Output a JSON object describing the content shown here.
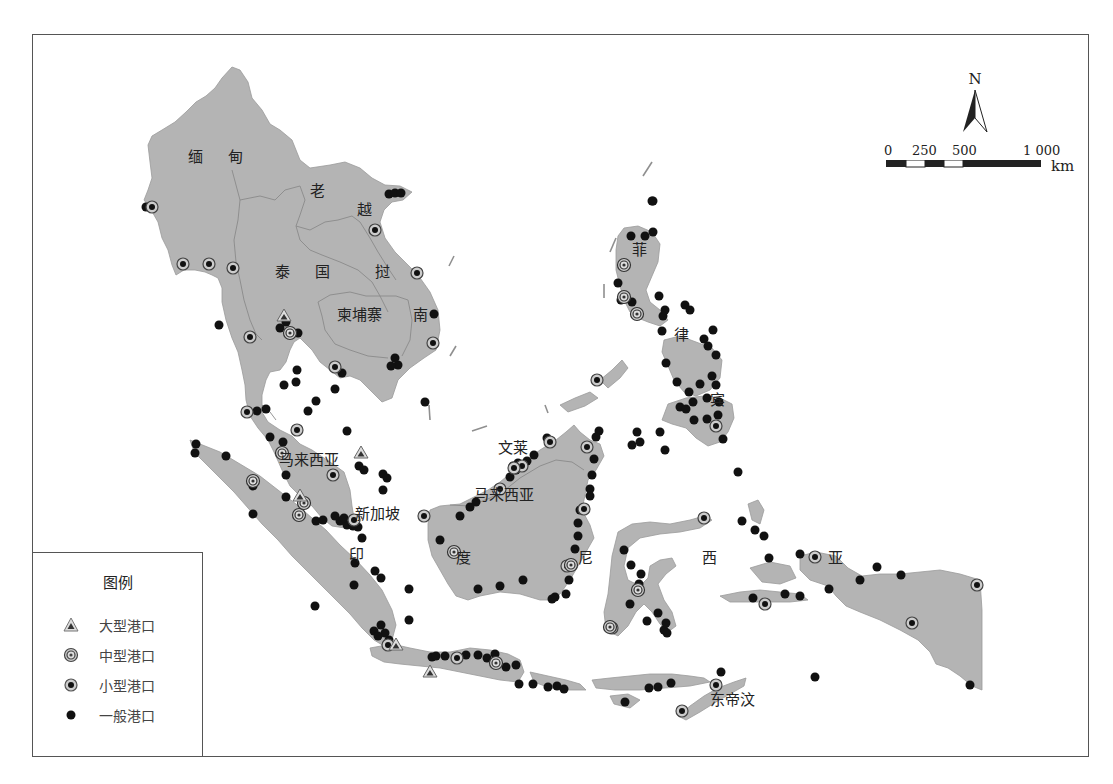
{
  "map": {
    "country_labels": [
      {
        "id": "myanmar",
        "text": "缅 甸",
        "x": 188,
        "y": 155
      },
      {
        "id": "laos",
        "text": "老",
        "x": 310,
        "y": 189
      },
      {
        "id": "vietnam-1",
        "text": "越",
        "x": 357,
        "y": 208
      },
      {
        "id": "thailand",
        "text": "泰 国",
        "x": 275,
        "y": 270
      },
      {
        "id": "vietnam-2",
        "text": "挝",
        "x": 375,
        "y": 270
      },
      {
        "id": "cambodia",
        "text": "柬埔寨",
        "x": 337,
        "y": 313
      },
      {
        "id": "vietnam-3",
        "text": "南",
        "x": 413,
        "y": 313
      },
      {
        "id": "philippines-1",
        "text": "菲",
        "x": 632,
        "y": 248
      },
      {
        "id": "philippines-2",
        "text": "律",
        "x": 674,
        "y": 333
      },
      {
        "id": "philippines-3",
        "text": "宾",
        "x": 710,
        "y": 398
      },
      {
        "id": "malaysia-west",
        "text": "马来西亚",
        "x": 279,
        "y": 458
      },
      {
        "id": "brunei",
        "text": "文莱",
        "x": 498,
        "y": 446
      },
      {
        "id": "malaysia-east",
        "text": "马来西亚",
        "x": 474,
        "y": 493
      },
      {
        "id": "singapore",
        "text": "新加坡",
        "x": 355,
        "y": 512
      },
      {
        "id": "indonesia-1",
        "text": "印",
        "x": 349,
        "y": 553
      },
      {
        "id": "indonesia-2",
        "text": "度",
        "x": 456,
        "y": 556
      },
      {
        "id": "indonesia-3",
        "text": "尼",
        "x": 578,
        "y": 556
      },
      {
        "id": "indonesia-4",
        "text": "西",
        "x": 702,
        "y": 556
      },
      {
        "id": "indonesia-5",
        "text": "亚",
        "x": 828,
        "y": 556
      },
      {
        "id": "east-timor",
        "text": "东帝汶",
        "x": 710,
        "y": 698
      }
    ],
    "compass": {
      "label": "N"
    },
    "scale_bar": {
      "ticks": [
        {
          "label": "0",
          "x": 4
        },
        {
          "label": "250",
          "x": 32
        },
        {
          "label": "500",
          "x": 72
        },
        {
          "label": "1 000",
          "x": 143
        }
      ],
      "unit": "km"
    }
  },
  "legend": {
    "title": "图例",
    "items": [
      {
        "symbol": "triangle",
        "label": "大型港口"
      },
      {
        "symbol": "double-ring",
        "label": "中型港口"
      },
      {
        "symbol": "ring-dot",
        "label": "小型港口"
      },
      {
        "symbol": "dot",
        "label": "一般港口"
      }
    ]
  },
  "ports": {
    "large": [
      [
        284,
        316
      ],
      [
        361,
        453
      ],
      [
        396,
        645
      ],
      [
        430,
        672
      ],
      [
        300,
        496
      ]
    ],
    "medium": [
      [
        624,
        265
      ],
      [
        624,
        297
      ],
      [
        637,
        314
      ],
      [
        282,
        453
      ],
      [
        253,
        481
      ],
      [
        299,
        515
      ],
      [
        304,
        503
      ],
      [
        610,
        627
      ],
      [
        638,
        590
      ],
      [
        571,
        565
      ],
      [
        454,
        552
      ],
      [
        496,
        663
      ],
      [
        290,
        333
      ]
    ],
    "small": [
      [
        152,
        207
      ],
      [
        183,
        264
      ],
      [
        209,
        264
      ],
      [
        233,
        268
      ],
      [
        250,
        337
      ],
      [
        247,
        412
      ],
      [
        297,
        430
      ],
      [
        375,
        230
      ],
      [
        417,
        273
      ],
      [
        433,
        343
      ],
      [
        335,
        367
      ],
      [
        333,
        475
      ],
      [
        522,
        466
      ],
      [
        550,
        442
      ],
      [
        587,
        447
      ],
      [
        584,
        509
      ],
      [
        567,
        566
      ],
      [
        597,
        380
      ],
      [
        716,
        426
      ],
      [
        704,
        518
      ],
      [
        424,
        516
      ],
      [
        500,
        489
      ],
      [
        514,
        468
      ],
      [
        765,
        604
      ],
      [
        912,
        623
      ],
      [
        977,
        585
      ],
      [
        716,
        685
      ],
      [
        682,
        711
      ],
      [
        612,
        628
      ],
      [
        457,
        658
      ],
      [
        388,
        645
      ],
      [
        815,
        557
      ],
      [
        354,
        520
      ]
    ],
    "general": [
      [
        146,
        207
      ],
      [
        389,
        194
      ],
      [
        395,
        193
      ],
      [
        401,
        193
      ],
      [
        219,
        325
      ],
      [
        280,
        328
      ],
      [
        286,
        322
      ],
      [
        292,
        334
      ],
      [
        298,
        333
      ],
      [
        297,
        370
      ],
      [
        284,
        385
      ],
      [
        296,
        382
      ],
      [
        316,
        401
      ],
      [
        335,
        389
      ],
      [
        308,
        411
      ],
      [
        342,
        373
      ],
      [
        398,
        365
      ],
      [
        395,
        358
      ],
      [
        391,
        366
      ],
      [
        434,
        314
      ],
      [
        425,
        402
      ],
      [
        266,
        409
      ],
      [
        257,
        411
      ],
      [
        270,
        437
      ],
      [
        283,
        442
      ],
      [
        347,
        431
      ],
      [
        359,
        466
      ],
      [
        364,
        470
      ],
      [
        383,
        474
      ],
      [
        387,
        478
      ],
      [
        383,
        490
      ],
      [
        286,
        475
      ],
      [
        196,
        444
      ],
      [
        195,
        453
      ],
      [
        226,
        456
      ],
      [
        253,
        486
      ],
      [
        253,
        514
      ],
      [
        286,
        497
      ],
      [
        316,
        521
      ],
      [
        323,
        520
      ],
      [
        340,
        521
      ],
      [
        347,
        525
      ],
      [
        358,
        527
      ],
      [
        335,
        516
      ],
      [
        344,
        518
      ],
      [
        353,
        526
      ],
      [
        362,
        538
      ],
      [
        355,
        563
      ],
      [
        354,
        585
      ],
      [
        375,
        571
      ],
      [
        381,
        578
      ],
      [
        409,
        589
      ],
      [
        381,
        625
      ],
      [
        389,
        640
      ],
      [
        385,
        633
      ],
      [
        374,
        631
      ],
      [
        378,
        636
      ],
      [
        315,
        606
      ],
      [
        409,
        620
      ],
      [
        432,
        657
      ],
      [
        436,
        656
      ],
      [
        445,
        656
      ],
      [
        466,
        655
      ],
      [
        478,
        655
      ],
      [
        487,
        658
      ],
      [
        495,
        654
      ],
      [
        506,
        667
      ],
      [
        516,
        665
      ],
      [
        519,
        684
      ],
      [
        533,
        684
      ],
      [
        548,
        687
      ],
      [
        557,
        686
      ],
      [
        564,
        689
      ],
      [
        625,
        702
      ],
      [
        649,
        688
      ],
      [
        658,
        687
      ],
      [
        671,
        683
      ],
      [
        721,
        672
      ],
      [
        652,
        201
      ],
      [
        631,
        236
      ],
      [
        645,
        236
      ],
      [
        653,
        232
      ],
      [
        618,
        283
      ],
      [
        621,
        300
      ],
      [
        632,
        302
      ],
      [
        659,
        296
      ],
      [
        663,
        316
      ],
      [
        665,
        310
      ],
      [
        662,
        331
      ],
      [
        685,
        305
      ],
      [
        690,
        310
      ],
      [
        713,
        330
      ],
      [
        704,
        339
      ],
      [
        708,
        346
      ],
      [
        716,
        355
      ],
      [
        666,
        363
      ],
      [
        677,
        382
      ],
      [
        689,
        392
      ],
      [
        700,
        384
      ],
      [
        712,
        376
      ],
      [
        716,
        385
      ],
      [
        680,
        407
      ],
      [
        686,
        409
      ],
      [
        693,
        402
      ],
      [
        707,
        398
      ],
      [
        719,
        402
      ],
      [
        718,
        415
      ],
      [
        723,
        439
      ],
      [
        707,
        419
      ],
      [
        694,
        420
      ],
      [
        660,
        432
      ],
      [
        665,
        450
      ],
      [
        640,
        442
      ],
      [
        637,
        432
      ],
      [
        632,
        445
      ],
      [
        599,
        431
      ],
      [
        594,
        459
      ],
      [
        592,
        475
      ],
      [
        590,
        489
      ],
      [
        590,
        496
      ],
      [
        580,
        510
      ],
      [
        578,
        523
      ],
      [
        578,
        536
      ],
      [
        575,
        549
      ],
      [
        569,
        580
      ],
      [
        555,
        597
      ],
      [
        552,
        599
      ],
      [
        566,
        594
      ],
      [
        523,
        580
      ],
      [
        500,
        586
      ],
      [
        478,
        589
      ],
      [
        440,
        540
      ],
      [
        534,
        455
      ],
      [
        527,
        461
      ],
      [
        518,
        463
      ],
      [
        516,
        470
      ],
      [
        513,
        466
      ],
      [
        476,
        502
      ],
      [
        470,
        507
      ],
      [
        460,
        516
      ],
      [
        547,
        438
      ],
      [
        510,
        477
      ],
      [
        596,
        437
      ],
      [
        624,
        550
      ],
      [
        631,
        565
      ],
      [
        641,
        574
      ],
      [
        639,
        584
      ],
      [
        630,
        604
      ],
      [
        658,
        613
      ],
      [
        664,
        630
      ],
      [
        666,
        623
      ],
      [
        667,
        633
      ],
      [
        647,
        621
      ],
      [
        742,
        521
      ],
      [
        755,
        530
      ],
      [
        764,
        536
      ],
      [
        769,
        558
      ],
      [
        800,
        554
      ],
      [
        815,
        558
      ],
      [
        877,
        567
      ],
      [
        901,
        575
      ],
      [
        753,
        598
      ],
      [
        785,
        594
      ],
      [
        800,
        596
      ],
      [
        860,
        580
      ],
      [
        829,
        589
      ],
      [
        970,
        685
      ],
      [
        815,
        677
      ],
      [
        738,
        472
      ],
      [
        653,
        201
      ]
    ]
  }
}
